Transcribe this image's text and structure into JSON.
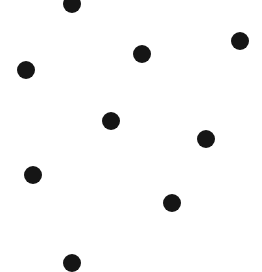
{
  "canvas": {
    "width": 262,
    "height": 266,
    "background": "#ffffff"
  },
  "dot_style": {
    "radius": 9,
    "color": "#151515"
  },
  "dots": [
    {
      "x": 72,
      "y": 4
    },
    {
      "x": 142,
      "y": 54
    },
    {
      "x": 240,
      "y": 41
    },
    {
      "x": 26,
      "y": 70
    },
    {
      "x": 111,
      "y": 121
    },
    {
      "x": 206,
      "y": 139
    },
    {
      "x": 33,
      "y": 175
    },
    {
      "x": 172,
      "y": 203
    },
    {
      "x": 72,
      "y": 263
    }
  ]
}
